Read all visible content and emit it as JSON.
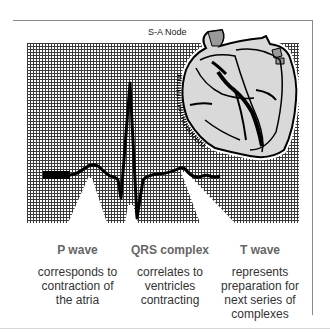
{
  "diagram": {
    "heart_label": "S-A Node",
    "columns": [
      {
        "title": "P wave",
        "description": [
          "corresponds to",
          "contraction of",
          "the atria"
        ]
      },
      {
        "title": "QRS complex",
        "description": [
          "correlates to",
          "ventricles",
          "contracting"
        ]
      },
      {
        "title": "T wave",
        "description": [
          "represents",
          "preparation for",
          "next series of",
          "complexes"
        ]
      }
    ],
    "colors": {
      "grid_line": "#3a3a3a",
      "trace": "#000000",
      "heart_fill": "#d9d9d9",
      "label_title": "#666666",
      "label_text": "#333333"
    }
  }
}
